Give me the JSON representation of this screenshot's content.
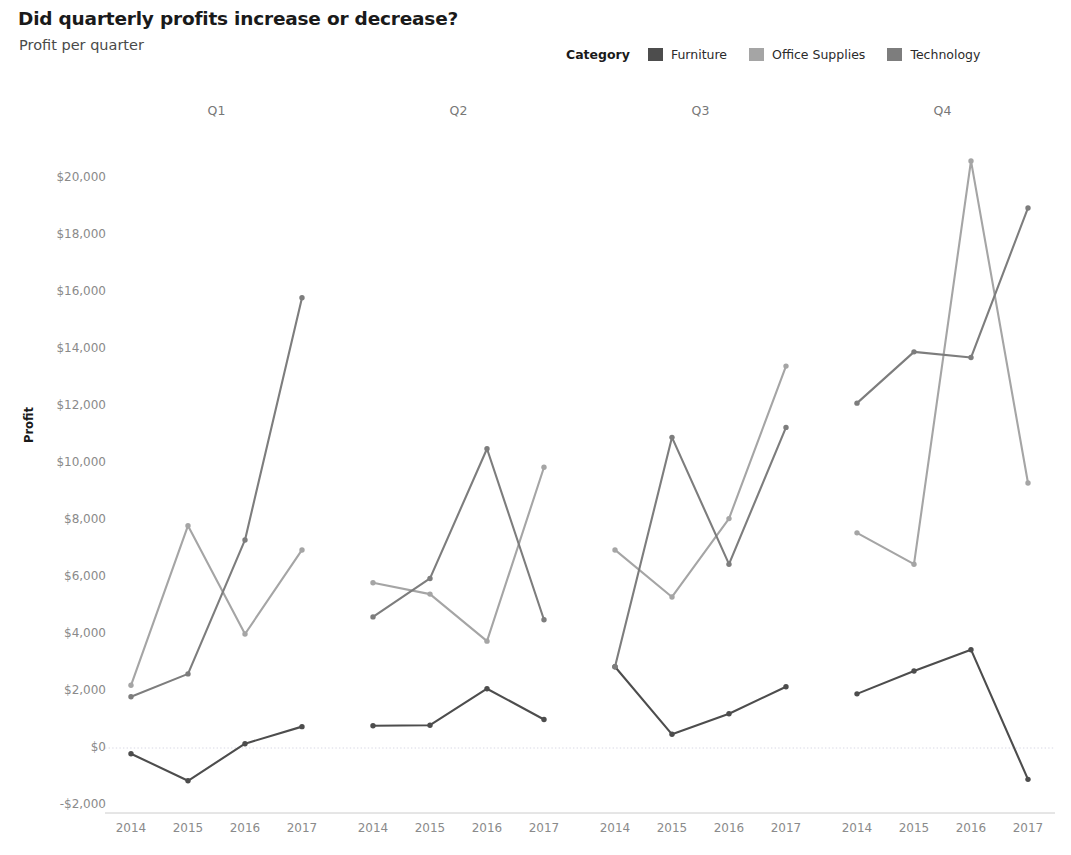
{
  "header": {
    "title": "Did quarterly profits increase or decrease?",
    "subtitle": "Profit per quarter"
  },
  "legend": {
    "title": "Category",
    "items": [
      {
        "label": "Furniture",
        "color": "#4d4d4d"
      },
      {
        "label": "Office Supplies",
        "color": "#a5a5a5"
      },
      {
        "label": "Technology",
        "color": "#7d7d7d"
      }
    ]
  },
  "axis": {
    "y_title": "Profit",
    "y_ticks": [
      "$20,000",
      "$18,000",
      "$16,000",
      "$14,000",
      "$12,000",
      "$10,000",
      "$8,000",
      "$6,000",
      "$4,000",
      "$2,000",
      "$0",
      "-$2,000"
    ]
  },
  "panels": [
    "Q1",
    "Q2",
    "Q3",
    "Q4"
  ],
  "x_categories": [
    "2014",
    "2015",
    "2016",
    "2017"
  ],
  "chart_data": {
    "type": "line",
    "title": "Did quarterly profits increase or decrease?",
    "subtitle": "Profit per quarter",
    "xlabel": "",
    "ylabel": "Profit",
    "ylim": [
      -2000,
      20800
    ],
    "y_tick_values": [
      20000,
      18000,
      16000,
      14000,
      12000,
      10000,
      8000,
      6000,
      4000,
      2000,
      0,
      -2000
    ],
    "y_tick_labels": [
      "$20,000",
      "$18,000",
      "$16,000",
      "$14,000",
      "$12,000",
      "$10,000",
      "$8,000",
      "$6,000",
      "$4,000",
      "$2,000",
      "$0",
      "-$2,000"
    ],
    "grid": false,
    "zero_reference_line": true,
    "legend_position": "top-right",
    "facet_by": "quarter",
    "facets": [
      "Q1",
      "Q2",
      "Q3",
      "Q4"
    ],
    "x": [
      "2014",
      "2015",
      "2016",
      "2017"
    ],
    "panels": [
      {
        "facet": "Q1",
        "series": [
          {
            "name": "Furniture",
            "color": "#4d4d4d",
            "values": [
              -200,
              -1150,
              150,
              750
            ]
          },
          {
            "name": "Office Supplies",
            "color": "#a5a5a5",
            "values": [
              2200,
              7800,
              4000,
              6950
            ]
          },
          {
            "name": "Technology",
            "color": "#7d7d7d",
            "values": [
              1800,
              2600,
              7300,
              15800
            ]
          }
        ]
      },
      {
        "facet": "Q2",
        "series": [
          {
            "name": "Furniture",
            "color": "#4d4d4d",
            "values": [
              780,
              800,
              2080,
              1000
            ]
          },
          {
            "name": "Office Supplies",
            "color": "#a5a5a5",
            "values": [
              5800,
              5400,
              3750,
              9850
            ]
          },
          {
            "name": "Technology",
            "color": "#7d7d7d",
            "values": [
              4600,
              5950,
              10500,
              4500
            ]
          }
        ]
      },
      {
        "facet": "Q3",
        "series": [
          {
            "name": "Furniture",
            "color": "#4d4d4d",
            "values": [
              2850,
              480,
              1200,
              2150
            ]
          },
          {
            "name": "Office Supplies",
            "color": "#a5a5a5",
            "values": [
              6950,
              5300,
              8050,
              13400
            ]
          },
          {
            "name": "Technology",
            "color": "#7d7d7d",
            "values": [
              2850,
              10900,
              6450,
              11250
            ]
          }
        ]
      },
      {
        "facet": "Q4",
        "series": [
          {
            "name": "Furniture",
            "color": "#4d4d4d",
            "values": [
              1900,
              2700,
              3450,
              -1100
            ]
          },
          {
            "name": "Office Supplies",
            "color": "#a5a5a5",
            "values": [
              7550,
              6450,
              20600,
              9300
            ]
          },
          {
            "name": "Technology",
            "color": "#7d7d7d",
            "values": [
              12100,
              13900,
              13700,
              18950
            ]
          }
        ]
      }
    ]
  }
}
